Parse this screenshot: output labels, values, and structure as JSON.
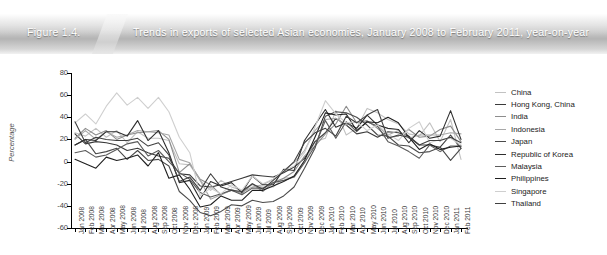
{
  "banner": {
    "figure_number": "Figure 1.4.",
    "title": "Trends in exports of selected Asian economies, January 2008 to February 2011, year-on-year"
  },
  "chart_data": {
    "type": "line",
    "title": "Trends in exports of selected Asian economies, January 2008 to February 2011, year-on-year",
    "xlabel": "",
    "ylabel": "Percentage",
    "ylim": [
      -60,
      80
    ],
    "yticks": [
      80,
      60,
      40,
      20,
      0,
      -20,
      -40,
      -60
    ],
    "grid": false,
    "legend_position": "right",
    "categories": [
      "Jan 2008",
      "Feb 2008",
      "Mar 2008",
      "Apr 2008",
      "May 2008",
      "Jun 2008",
      "Jul 2008",
      "Aug 2008",
      "Sep 2008",
      "Oct 2008",
      "Nov 2008",
      "Dec 2008",
      "Jan 2009",
      "Feb 2009",
      "Mar 2009",
      "Apr 2009",
      "May 2009",
      "Jun 2009",
      "Jul 2009",
      "Aug 2009",
      "Sep 2009",
      "Oct 2009",
      "Nov 2009",
      "Dec 2009",
      "Jan 2010",
      "Feb 2010",
      "Mar 2010",
      "Apr 2010",
      "May 2010",
      "Jun 2010",
      "Jul 2010",
      "Aug 2010",
      "Sep 2010",
      "Oct 2010",
      "Nov 2010",
      "Dec 2010",
      "Jan 2011",
      "Feb 2011"
    ],
    "series": [
      {
        "name": "China",
        "color": "#c2c2c2",
        "values": [
          26,
          23,
          30,
          22,
          28,
          17,
          27,
          21,
          21,
          19,
          -2,
          -3,
          -17,
          -26,
          -17,
          -23,
          -26,
          -21,
          -23,
          -23,
          -15,
          -14,
          -1,
          18,
          21,
          46,
          24,
          30,
          48,
          44,
          38,
          34,
          25,
          23,
          35,
          18,
          38,
          2
        ]
      },
      {
        "name": "Hong Kong, China",
        "color": "#3a3a3a",
        "values": [
          25,
          16,
          18,
          17,
          15,
          10,
          12,
          8,
          5,
          3,
          -11,
          -12,
          -22,
          -23,
          -21,
          -18,
          -15,
          -12,
          -13,
          -14,
          -10,
          -5,
          3,
          18,
          26,
          39,
          33,
          25,
          27,
          22,
          27,
          26,
          23,
          15,
          15,
          13,
          24,
          12
        ]
      },
      {
        "name": "India",
        "color": "#8d8d8d",
        "values": [
          21,
          30,
          24,
          28,
          20,
          24,
          26,
          27,
          28,
          20,
          -10,
          -2,
          -16,
          -21,
          -30,
          -25,
          -29,
          -20,
          -27,
          -19,
          -15,
          -9,
          5,
          14,
          25,
          34,
          50,
          35,
          37,
          30,
          22,
          23,
          29,
          22,
          23,
          29,
          32,
          18
        ]
      },
      {
        "name": "Indonesia",
        "color": "#a8a8a8",
        "values": [
          20,
          28,
          20,
          27,
          22,
          24,
          28,
          27,
          26,
          24,
          2,
          -1,
          -17,
          -34,
          -30,
          -26,
          -28,
          -23,
          -21,
          -16,
          -8,
          -1,
          10,
          28,
          38,
          39,
          33,
          36,
          36,
          32,
          24,
          28,
          21,
          24,
          24,
          24,
          26,
          25
        ]
      },
      {
        "name": "Japan",
        "color": "#4a4a4a",
        "values": [
          15,
          20,
          7,
          9,
          12,
          2,
          10,
          1,
          2,
          -4,
          -27,
          -35,
          -46,
          -49,
          -45,
          -39,
          -40,
          -35,
          -37,
          -36,
          -31,
          -23,
          -6,
          12,
          41,
          45,
          44,
          40,
          33,
          24,
          23,
          15,
          14,
          8,
          9,
          13,
          1,
          12
        ]
      },
      {
        "name": "Republic of Korea",
        "color": "#2e2e2e",
        "values": [
          15,
          20,
          19,
          27,
          27,
          23,
          37,
          19,
          28,
          8,
          -19,
          -17,
          -34,
          -18,
          -22,
          -19,
          -28,
          -13,
          -21,
          -21,
          -7,
          -8,
          19,
          33,
          47,
          31,
          35,
          30,
          42,
          33,
          30,
          29,
          17,
          28,
          21,
          23,
          46,
          20
        ]
      },
      {
        "name": "Malaysia",
        "color": "#5c5c5c",
        "values": [
          8,
          10,
          4,
          6,
          11,
          16,
          18,
          5,
          10,
          0,
          -10,
          -16,
          -28,
          -32,
          -29,
          -26,
          -30,
          -24,
          -24,
          -19,
          -17,
          -14,
          -1,
          14,
          37,
          21,
          36,
          27,
          36,
          32,
          18,
          14,
          9,
          3,
          15,
          9,
          14,
          14
        ]
      },
      {
        "name": "Philippines",
        "color": "#1f1f1f",
        "values": [
          2,
          -2,
          -6,
          4,
          1,
          3,
          6,
          -4,
          8,
          -15,
          -12,
          -25,
          -41,
          -39,
          -31,
          -35,
          -35,
          -26,
          -26,
          -22,
          -18,
          -13,
          1,
          22,
          44,
          42,
          43,
          28,
          36,
          35,
          40,
          35,
          22,
          11,
          16,
          11,
          13,
          14
        ]
      },
      {
        "name": "Singapore",
        "color": "#cfcfcf",
        "values": [
          35,
          43,
          34,
          50,
          62,
          51,
          58,
          48,
          58,
          45,
          22,
          8,
          -31,
          -24,
          -29,
          -21,
          -26,
          -13,
          -20,
          -16,
          -8,
          -4,
          8,
          31,
          55,
          43,
          35,
          36,
          28,
          33,
          25,
          19,
          30,
          36,
          17,
          20,
          21,
          15
        ]
      },
      {
        "name": "Thailand",
        "color": "#404040",
        "values": [
          36,
          17,
          22,
          20,
          19,
          19,
          21,
          14,
          17,
          6,
          -18,
          -14,
          -26,
          -11,
          -23,
          -26,
          -27,
          -20,
          -25,
          -17,
          -9,
          0,
          17,
          26,
          30,
          23,
          41,
          35,
          42,
          47,
          21,
          24,
          22,
          15,
          19,
          19,
          22,
          17
        ]
      }
    ]
  },
  "yaxis": {
    "title": "Percentage",
    "ticks": [
      "80",
      "60",
      "40",
      "20",
      "0",
      "-20",
      "-40",
      "-60"
    ]
  },
  "legend": {
    "items": [
      {
        "label": "China",
        "color": "#c2c2c2"
      },
      {
        "label": "Hong Kong, China",
        "color": "#3a3a3a"
      },
      {
        "label": "India",
        "color": "#8d8d8d"
      },
      {
        "label": "Indonesia",
        "color": "#a8a8a8"
      },
      {
        "label": "Japan",
        "color": "#4a4a4a"
      },
      {
        "label": "Republic of Korea",
        "color": "#2e2e2e"
      },
      {
        "label": "Malaysia",
        "color": "#5c5c5c"
      },
      {
        "label": "Philippines",
        "color": "#1f1f1f"
      },
      {
        "label": "Singapore",
        "color": "#cfcfcf"
      },
      {
        "label": "Thailand",
        "color": "#404040"
      }
    ]
  }
}
